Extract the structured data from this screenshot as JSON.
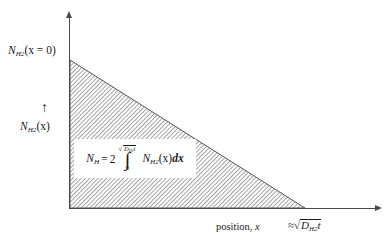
{
  "figure": {
    "type": "schematic-diagram",
    "background_color": "#ffffff",
    "line_color": "#4a4a4a",
    "text_color": "#1a1a1a",
    "hatch_color": "#555555"
  },
  "axes": {
    "y_axis": {
      "name": "vertical-axis",
      "arrow": "up",
      "top_label": {
        "symbol": "N",
        "subscript": "H",
        "sub_subscript": "2",
        "argument": "(x = 0)",
        "full_text": "N_H2(x = 0)"
      },
      "mid_label": {
        "arrow_glyph": "↑",
        "symbol": "N",
        "subscript": "H",
        "sub_subscript": "2",
        "argument": "(x)",
        "full_text": "N_H2(x)"
      }
    },
    "x_axis": {
      "name": "horizontal-axis",
      "arrow": "right",
      "label": "position, x",
      "label_plain": "position,",
      "label_variable": "x",
      "end_marker": {
        "approx_symbol": "≈",
        "radicand_symbol": "D",
        "radicand_subscript": "H",
        "radicand_sub_subscript": "2",
        "radicand_tail": "t",
        "full_text": "≈ √(D_H2 t)"
      }
    }
  },
  "profile": {
    "name": "linear-concentration-profile",
    "shape": "right-triangle",
    "fill": "diagonal-hatch",
    "hatch_angle_deg": 45,
    "hatch_spacing_px": 3,
    "vertices_px": [
      [
        70,
        60
      ],
      [
        70,
        208
      ],
      [
        305,
        208
      ]
    ]
  },
  "equation": {
    "name": "total-hydrogen-integral",
    "lhs_symbol": "N",
    "lhs_subscript": "H",
    "equals": "=",
    "coefficient": "2",
    "integral_sign": "∫",
    "lower_limit": "0",
    "upper_limit_radicand_symbol": "D",
    "upper_limit_radicand_subscript": "H",
    "upper_limit_radicand_sub_subscript": "2",
    "upper_limit_radicand_tail": "t",
    "integrand_symbol": "N",
    "integrand_subscript": "H",
    "integrand_sub_subscript": "2",
    "integrand_argument": "(x)",
    "differential": "dx",
    "full_text": "N_H = 2 ∫_0^√(D_H2 t) N_H2(x) dx"
  }
}
